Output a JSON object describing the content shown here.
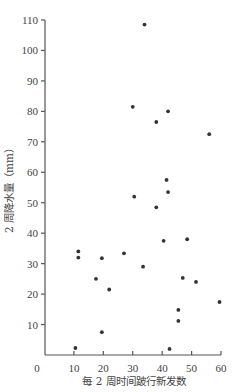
{
  "chart_data": {
    "type": "scatter",
    "title": "",
    "xlabel": "每 2 周时间跛行新发数",
    "ylabel": "2 周降水量（mm）",
    "xlim": [
      0,
      60
    ],
    "ylim": [
      0,
      110
    ],
    "xticks": [
      0,
      10,
      20,
      30,
      40,
      50,
      60
    ],
    "yticks": [
      10,
      20,
      30,
      40,
      50,
      60,
      70,
      80,
      90,
      100,
      110
    ],
    "grid": false,
    "legend": null,
    "points": [
      {
        "x": 34,
        "y": 108.5
      },
      {
        "x": 30,
        "y": 81.5
      },
      {
        "x": 42,
        "y": 80
      },
      {
        "x": 38,
        "y": 76.5
      },
      {
        "x": 56,
        "y": 72.5
      },
      {
        "x": 41.5,
        "y": 57.5
      },
      {
        "x": 42,
        "y": 53.5
      },
      {
        "x": 30.5,
        "y": 52
      },
      {
        "x": 38,
        "y": 48.5
      },
      {
        "x": 40.5,
        "y": 37.5
      },
      {
        "x": 48.5,
        "y": 38
      },
      {
        "x": 11.5,
        "y": 34
      },
      {
        "x": 11.5,
        "y": 32
      },
      {
        "x": 19.5,
        "y": 31.8
      },
      {
        "x": 27,
        "y": 33.4
      },
      {
        "x": 33.5,
        "y": 29
      },
      {
        "x": 17.5,
        "y": 25
      },
      {
        "x": 22,
        "y": 21.5
      },
      {
        "x": 47,
        "y": 25.3
      },
      {
        "x": 51.5,
        "y": 24
      },
      {
        "x": 59.5,
        "y": 17.4
      },
      {
        "x": 45.5,
        "y": 14.8
      },
      {
        "x": 45.5,
        "y": 11.2
      },
      {
        "x": 19.5,
        "y": 7.5
      },
      {
        "x": 10.5,
        "y": 2.3
      },
      {
        "x": 42.5,
        "y": 2
      }
    ]
  },
  "labels": {
    "x_axis_title": "每 2 周时间跛行新发数",
    "y_axis_title": "2 周降水量（mm）",
    "origin": "0"
  }
}
